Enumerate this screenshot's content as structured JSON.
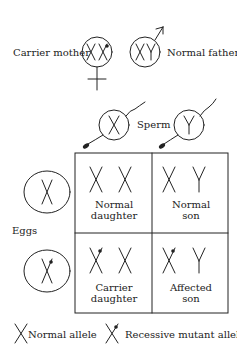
{
  "parents": {
    "mother": {
      "label": "Carrier mother",
      "genotype": "XX (one recessive mutant)",
      "symbol": "female-symbol"
    },
    "father": {
      "label": "Normal father",
      "genotype": "XY",
      "symbol": "male-symbol"
    }
  },
  "gametes": {
    "sperm_label": "Sperm",
    "eggs_label": "Eggs",
    "sperm": [
      "X",
      "Y"
    ],
    "eggs": [
      "X (normal)",
      "X (recessive mutant)"
    ]
  },
  "punnett": {
    "cells": [
      {
        "label_line1": "Normal",
        "label_line2": "daughter",
        "genotype": "XX"
      },
      {
        "label_line1": "Normal",
        "label_line2": "son",
        "genotype": "XY"
      },
      {
        "label_line1": "Carrier",
        "label_line2": "daughter",
        "genotype": "X*X"
      },
      {
        "label_line1": "Affected",
        "label_line2": "son",
        "genotype": "X*Y"
      }
    ]
  },
  "legend": {
    "normal": "Normal allele",
    "mutant": "Recessive mutant allele"
  },
  "colors": {
    "ink": "#222222",
    "background": "#ffffff"
  }
}
